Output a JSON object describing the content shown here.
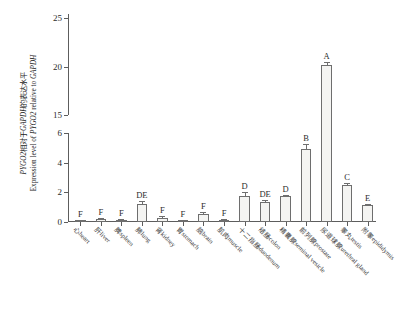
{
  "chart_data": {
    "type": "bar",
    "title": "",
    "subtitle": "",
    "xlabel": "",
    "ylabel_cn": "PYGO2相对于GAPDH的表达水平",
    "ylabel_en": "Expression level of PYGO2 relative to GAPDH",
    "ylabel_italic_parts": [
      "PYGO2",
      "GAPDH"
    ],
    "axis_break": true,
    "lower_segment": {
      "min": 0,
      "max": 6,
      "ticks": [
        0,
        2,
        4,
        6
      ]
    },
    "upper_segment": {
      "min": 15,
      "max": 25,
      "ticks": [
        15,
        20,
        25
      ]
    },
    "grid": false,
    "legend": "none",
    "categories": [
      "心heart",
      "肝liver",
      "脾spleen",
      "肺lung",
      "肾kidney",
      "胃stomach",
      "脑brain",
      "肌肉muscle",
      "十二指肠duodenum",
      "结肠colon",
      "精囊腺seminal vesicle",
      "前列腺prostate",
      "尿道球腺urethral gland",
      "睾丸testis",
      "附睾epididymis"
    ],
    "values": [
      0.06,
      0.2,
      0.13,
      1.22,
      0.29,
      0.07,
      0.55,
      0.13,
      1.78,
      1.37,
      1.74,
      4.9,
      20.2,
      2.52,
      1.12
    ],
    "errors": [
      0.05,
      0.07,
      0.06,
      0.18,
      0.09,
      0.04,
      0.1,
      0.07,
      0.22,
      0.12,
      0.09,
      0.33,
      0.3,
      0.08,
      0.1
    ],
    "significance_labels": [
      "F",
      "F",
      "F",
      "DE",
      "F",
      "F",
      "F",
      "F",
      "D",
      "DE",
      "D",
      "B",
      "A",
      "C",
      "E"
    ]
  },
  "caption": {
    "text": ""
  }
}
